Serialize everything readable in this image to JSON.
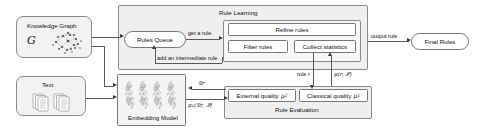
{
  "diagram": {
    "nodes": {
      "knowledge_graph": {
        "label": "Knowledge Graph",
        "symbol": "G",
        "icon": "graph-nodes-icon"
      },
      "text": {
        "label": "Text",
        "icon": "document-stack-icon"
      },
      "rules_queue": {
        "label": "Rules Queue"
      },
      "refine_rules": {
        "label": "Refine rules"
      },
      "filter_rules": {
        "label": "Filter rules"
      },
      "collect_statistics": {
        "label": "Collect statistics"
      },
      "final_rules": {
        "label": "Final Rules"
      },
      "embedding_model": {
        "label": "Embedding Model",
        "icon": "embedding-vectors-icon"
      },
      "external_quality": {
        "label": "External quality",
        "symbol": "μ",
        "subscript": "2"
      },
      "classical_quality": {
        "label": "Classical quality",
        "symbol": "μ",
        "subscript": "1"
      }
    },
    "sections": {
      "rule_learning": {
        "label": "Rule Learning"
      },
      "rule_evaluation": {
        "label": "Rule Evaluation"
      }
    },
    "edges": {
      "get_a_rule": {
        "label": "get a rule"
      },
      "add_intermediate_rule": {
        "label": "add an intermediate rule"
      },
      "output_rule": {
        "label": "output rule"
      },
      "rule_r": {
        "label": "rule r"
      },
      "mu_r_p": {
        "label": "μ(r, 𝒫)"
      },
      "g_r": {
        "label": "𝒢r"
      },
      "mu2_gr_p": {
        "label": "μ₂(𝒢r, 𝒫)"
      }
    },
    "colors": {
      "rounded_fill": "#f2f2f2",
      "panel_fill": "#efefef",
      "panel_inner_fill": "#f7f7f7",
      "box_fill": "#ffffff",
      "stroke": "#8a8a8a",
      "arrow": "#3a3a3a",
      "text": "#111111"
    }
  }
}
